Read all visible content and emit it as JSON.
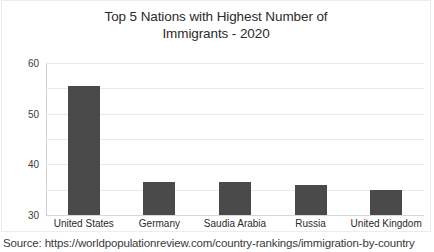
{
  "chart_data": {
    "type": "bar",
    "title": "Top 5 Nations with Highest Number of Immigrants - 2020",
    "title_lines": [
      "Top 5 Nations with Highest Number of",
      "Immigrants - 2020"
    ],
    "categories": [
      "United States",
      "Germany",
      "Saudia Arabia",
      "Russia",
      "United Kingdom"
    ],
    "values": [
      51,
      13,
      13,
      12,
      10
    ],
    "xlabel": "",
    "ylabel": "",
    "ylim": [
      0,
      60
    ],
    "yticks": [
      0,
      10,
      20,
      30,
      40,
      50,
      60
    ],
    "ytick_labels": [
      "0",
      "10",
      "20",
      "30",
      "40",
      "50",
      "60"
    ],
    "grid": true,
    "legend": false,
    "bar_color": "#4a4a4a"
  },
  "caption": {
    "source_text": "Source: https://worldpopulationreview.com/country-rankings/immigration-by-country"
  },
  "colors": {
    "bar": "#4a4a4a",
    "gridline": "#e9e9e9",
    "frame_border": "#ededed",
    "text": "#2b2b2b",
    "background": "#ffffff"
  }
}
